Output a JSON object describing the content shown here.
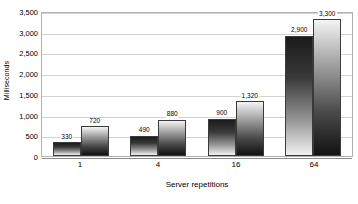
{
  "chart_data": {
    "type": "bar",
    "title": "",
    "subtitle": "",
    "xlabel": "Server repetitions",
    "ylabel": "Milliseconds",
    "categories": [
      "1",
      "4",
      "16",
      "64"
    ],
    "series": [
      {
        "name": "series-1",
        "values": [
          330,
          490,
          900,
          2900
        ],
        "value_labels": [
          "330",
          "490",
          "900",
          "2,900"
        ],
        "gradient": "dark-top-to-light-bottom"
      },
      {
        "name": "series-2",
        "values": [
          720,
          880,
          1320,
          3300
        ],
        "value_labels": [
          "720",
          "880",
          "1,320",
          "3,300"
        ],
        "gradient": "light-top-to-dark-bottom"
      }
    ],
    "ylim": [
      0,
      3500
    ],
    "ytick_step": 500,
    "ytick_labels": [
      "3,500",
      "3,000",
      "2,500",
      "2,000",
      "1,500",
      "1,000",
      "500",
      "0"
    ],
    "ytick_values": [
      3500,
      3000,
      2500,
      2000,
      1500,
      1000,
      500,
      0
    ],
    "grid": "horizontal-only",
    "legend": "none",
    "data_labels_shown": true,
    "colors": {
      "gridline": "#d2d2d2",
      "axis_border": "#b0b0b0",
      "baseline": "#8a8a8a",
      "bar_outline": "#3a3a3a",
      "background": "#ffffff",
      "text": "#000000"
    }
  }
}
